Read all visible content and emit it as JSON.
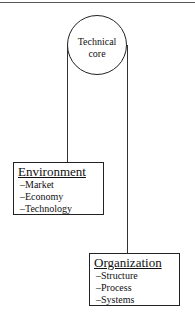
{
  "diagram": {
    "core": {
      "label_line1": "Technical",
      "label_line2": "core"
    },
    "environment": {
      "title": "Environment",
      "items": [
        "–Market",
        "–Economy",
        "–Technology"
      ]
    },
    "organization": {
      "title": "Organization",
      "items": [
        "–Structure",
        "–Process",
        "–Systems"
      ]
    }
  }
}
